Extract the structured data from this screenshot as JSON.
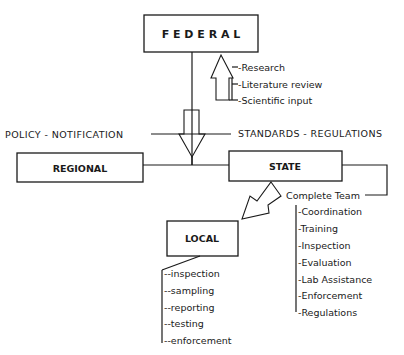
{
  "nodes": {
    "federal": {
      "label": "F E D E R A L"
    },
    "regional": {
      "label": "REGIONAL"
    },
    "state": {
      "label": "STATE"
    },
    "local": {
      "label": "LOCAL"
    }
  },
  "inputs_to_federal": [
    "-Research",
    "-Literature review",
    "-Scientific input"
  ],
  "flow_labels": {
    "left": "POLICY - NOTIFICATION",
    "right": "STANDARDS - REGULATIONS"
  },
  "state_team": {
    "title": "Complete Team",
    "items": [
      "-Coordination",
      "-Training",
      "-Inspection",
      "-Evaluation",
      "-Lab Assistance",
      "-Enforcement",
      "-Regulations"
    ]
  },
  "local_tasks": {
    "items": [
      "--inspection",
      "--sampling",
      "--reporting",
      "--testing",
      "--enforcement"
    ]
  },
  "colors": {
    "ink": "#1a1a1a",
    "paper": "#ffffff"
  }
}
